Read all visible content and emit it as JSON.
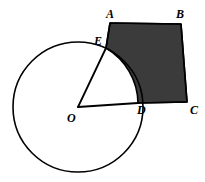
{
  "figure": {
    "background_color": "#ffffff",
    "stroke_color": "#000000",
    "shaded_fill_color": "#3b3b3b",
    "stroke_width": 1.6,
    "circle": {
      "name": "circle-O",
      "center_x": 78,
      "center_y": 107,
      "radius": 65
    },
    "points": {
      "A": {
        "label": "A",
        "x": 110,
        "y": 23,
        "label_x": 106,
        "label_y": 8
      },
      "B": {
        "label": "B",
        "x": 181,
        "y": 24,
        "label_x": 176,
        "label_y": 8
      },
      "C": {
        "label": "C",
        "x": 187,
        "y": 102,
        "label_x": 190,
        "label_y": 104
      },
      "D": {
        "label": "D",
        "x": 138,
        "y": 103,
        "label_x": 137,
        "label_y": 104
      },
      "E": {
        "label": "E",
        "x": 106,
        "y": 48,
        "label_x": 94,
        "label_y": 35
      },
      "O": {
        "label": "O",
        "x": 78,
        "y": 107,
        "label_x": 67,
        "label_y": 112
      }
    },
    "segments": [
      {
        "name": "segment-E-A",
        "from": "E",
        "to": "A"
      },
      {
        "name": "segment-A-B",
        "from": "A",
        "to": "B"
      },
      {
        "name": "segment-B-C",
        "from": "B",
        "to": "C"
      },
      {
        "name": "segment-C-D",
        "from": "C",
        "to": "D"
      },
      {
        "name": "radius-O-E",
        "from": "O",
        "to": "E"
      },
      {
        "name": "radius-O-D",
        "from": "O",
        "to": "D"
      }
    ],
    "arc": {
      "name": "arc-E-D",
      "from": "E",
      "to": "D",
      "description": "minor arc of circle O from E to D"
    },
    "shaded_region": {
      "name": "shaded-region-ABCD",
      "path": "M 106 48 L 110 23 L 181 24 L 187 102 L 138 103 A 65 65 0 0 0 106 48 Z"
    }
  }
}
